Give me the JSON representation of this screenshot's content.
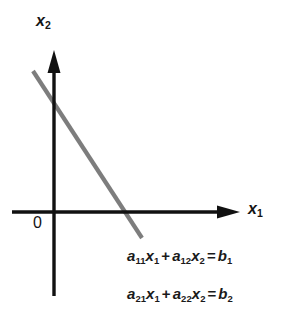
{
  "figure": {
    "type": "diagram",
    "background_color": "#ffffff",
    "axes": {
      "x_axis": {
        "label": "x",
        "label_subscript": "1",
        "color": "#111111",
        "arrow": "right"
      },
      "y_axis": {
        "label": "x",
        "label_subscript": "2",
        "color": "#111111",
        "arrow": "up"
      },
      "origin_label": "0"
    },
    "line": {
      "name": "solution-line",
      "color": "#7d7d7d",
      "width": 4.2,
      "start": [
        33,
        71
      ],
      "end": [
        142,
        238
      ]
    },
    "equations": [
      {
        "terms": [
          {
            "coef": "a",
            "coef_sub": "11",
            "var": "x",
            "var_sub": "1"
          },
          {
            "op": "+"
          },
          {
            "coef": "a",
            "coef_sub": "12",
            "var": "x",
            "var_sub": "2"
          },
          {
            "op": "="
          },
          {
            "coef": "b",
            "coef_sub": "1"
          }
        ],
        "text": "a11x1 + a12x2 = b1"
      },
      {
        "terms": [
          {
            "coef": "a",
            "coef_sub": "21",
            "var": "x",
            "var_sub": "1"
          },
          {
            "op": "+"
          },
          {
            "coef": "a",
            "coef_sub": "22",
            "var": "x",
            "var_sub": "2"
          },
          {
            "op": "="
          },
          {
            "coef": "b",
            "coef_sub": "2"
          }
        ],
        "text": "a21x1 + a22x2 = b2"
      }
    ]
  }
}
